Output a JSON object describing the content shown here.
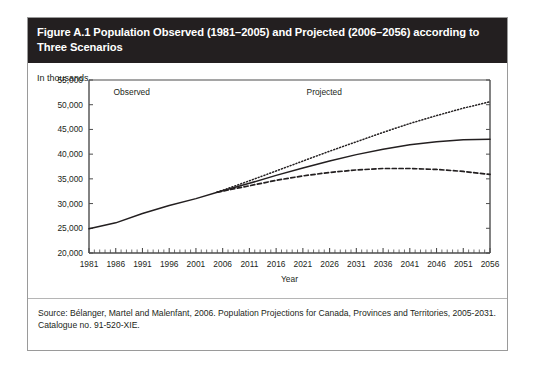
{
  "figure": {
    "title": "Figure A.1 Population Observed (1981–2005) and Projected (2006–2056) according to Three Scenarios",
    "unit_label": "In thousands",
    "source": "Source: Bélanger, Martel and Malenfant, 2006. Population Projections for Canada, Provinces and Territories, 2005-2031.\nCatalogue no. 91-520-XIE.",
    "colors": {
      "header_background": "#231f20",
      "header_text": "#ffffff",
      "border": "#9a9a9a",
      "line": "#231f20",
      "page_background": "#ffffff"
    }
  },
  "chart_data": {
    "type": "line",
    "title": "Figure A.1 Population Observed (1981–2005) and Projected (2006–2056) according to Three Scenarios",
    "xlabel": "Year",
    "ylabel": "In thousands",
    "xlim": [
      1981,
      2056
    ],
    "ylim": [
      20000,
      55000
    ],
    "ytick_labels": [
      "20,000",
      "25,000",
      "30,000",
      "35,000",
      "40,000",
      "45,000",
      "50,000",
      "55,000"
    ],
    "yticks": [
      20000,
      25000,
      30000,
      35000,
      40000,
      45000,
      50000,
      55000
    ],
    "xtick_labels": [
      "1981",
      "1986",
      "1991",
      "1996",
      "2001",
      "2006",
      "2011",
      "2016",
      "2021",
      "2026",
      "2031",
      "2036",
      "2041",
      "2046",
      "2051",
      "2056"
    ],
    "xticks": [
      1981,
      1986,
      1991,
      1996,
      2001,
      2006,
      2011,
      2016,
      2021,
      2026,
      2031,
      2036,
      2041,
      2046,
      2051,
      2056
    ],
    "minor_xtick_interval": 1,
    "grid": false,
    "legend_position": "none",
    "annotations": [
      {
        "text": "Observed",
        "x": 1989,
        "y": 52000
      },
      {
        "text": "Projected",
        "x": 2025,
        "y": 52000
      }
    ],
    "series": [
      {
        "name": "Observed",
        "style": "solid",
        "x": [
          1981,
          1986,
          1991,
          1996,
          2001,
          2005
        ],
        "values": [
          24900,
          26100,
          28000,
          29600,
          31000,
          32300
        ]
      },
      {
        "name": "High-growth scenario",
        "style": "dotted",
        "x": [
          2005,
          2011,
          2016,
          2021,
          2026,
          2031,
          2036,
          2041,
          2046,
          2051,
          2056
        ],
        "values": [
          32300,
          34600,
          36600,
          38600,
          40600,
          42500,
          44400,
          46200,
          47800,
          49300,
          50600
        ]
      },
      {
        "name": "Medium-growth scenario",
        "style": "solid",
        "x": [
          2005,
          2011,
          2016,
          2021,
          2026,
          2031,
          2036,
          2041,
          2046,
          2051,
          2056
        ],
        "values": [
          32300,
          34100,
          35700,
          37200,
          38600,
          39900,
          41000,
          41900,
          42500,
          42900,
          43000
        ]
      },
      {
        "name": "Low-growth scenario",
        "style": "dashed",
        "x": [
          2005,
          2011,
          2016,
          2021,
          2026,
          2031,
          2036,
          2041,
          2046,
          2051,
          2056
        ],
        "values": [
          32300,
          33600,
          34700,
          35600,
          36300,
          36800,
          37100,
          37100,
          36900,
          36500,
          35900
        ]
      }
    ]
  }
}
